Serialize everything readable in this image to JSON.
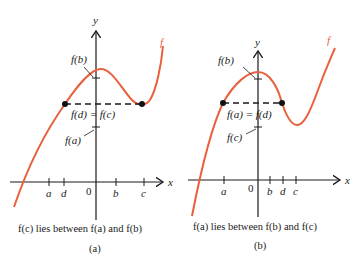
{
  "colors": {
    "curve": "#e8603c",
    "axis": "#1a1a1a",
    "background": "#ffffff"
  },
  "panels": [
    {
      "id": "a",
      "panel_label": "(a)",
      "caption": "f(c) lies between f(a) and f(b)",
      "axis_labels": {
        "x": "x",
        "y": "y",
        "origin": "0"
      },
      "curve_label": "f",
      "x_ticks": [
        "a",
        "d",
        "b",
        "c"
      ],
      "y_labels": {
        "top": "f(b)",
        "middle": "f(d) = f(c)",
        "bottom": "f(a)"
      }
    },
    {
      "id": "b",
      "panel_label": "(b)",
      "caption": "f(a) lies between f(b) and f(c)",
      "axis_labels": {
        "x": "x",
        "y": "y",
        "origin": "0"
      },
      "curve_label": "f",
      "x_ticks": [
        "a",
        "b",
        "d",
        "c"
      ],
      "y_labels": {
        "top": "f(b)",
        "middle": "f(a) = f(d)",
        "bottom": "f(c)"
      }
    }
  ]
}
